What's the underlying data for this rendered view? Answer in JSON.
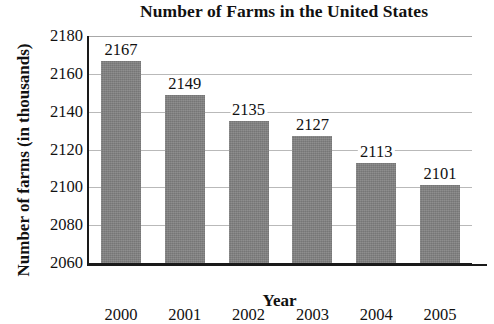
{
  "chart_data": {
    "type": "bar",
    "title": "Number of Farms in the United States",
    "xlabel": "Year",
    "ylabel": "Number of farms (in thousands)",
    "categories": [
      "2000",
      "2001",
      "2002",
      "2003",
      "2004",
      "2005"
    ],
    "values": [
      2167,
      2149,
      2135,
      2127,
      2113,
      2101
    ],
    "value_labels": [
      "2167",
      "2149",
      "2135",
      "2127",
      "2113",
      "2101"
    ],
    "ylim": [
      2060,
      2180
    ],
    "yticks": [
      2180,
      2160,
      2140,
      2120,
      2100,
      2080,
      2060
    ],
    "ytick_labels": [
      "2180",
      "2160",
      "2140",
      "2120",
      "2100",
      "2080",
      "2060"
    ],
    "grid": true,
    "grid_axis": "y",
    "legend": null,
    "bar_color": "#818181",
    "axis_color": "#1a1a1a",
    "grid_color": "#b9b9b9",
    "background_color": "#ffffff",
    "text_color": "#111111"
  }
}
